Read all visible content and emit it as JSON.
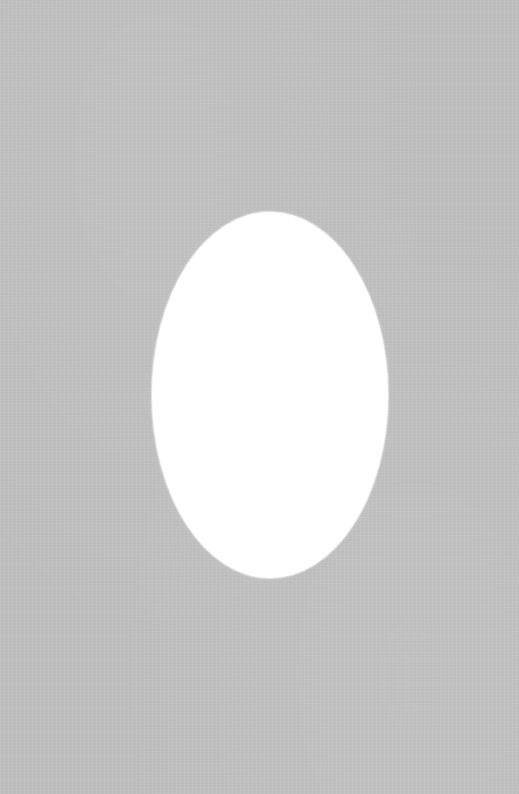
{
  "scene": {
    "description": "Grey textured mat board with a white oval opening",
    "mat_color": "#bcbcbc",
    "opening_color": "#ffffff",
    "opening_shape": "oval"
  }
}
